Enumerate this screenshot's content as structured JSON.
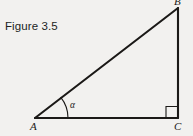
{
  "figure": {
    "caption": "Figure 3.5",
    "background_color": "#f2f1ef",
    "stroke_color": "#1b1917",
    "text_color": "#211f1e"
  },
  "diagram": {
    "type": "right-triangle",
    "vertices": [
      {
        "id": "A",
        "label": "A",
        "x": 35,
        "y": 118,
        "role": "acute-angle-vertex"
      },
      {
        "id": "B",
        "label": "B",
        "x": 178,
        "y": 8,
        "role": "apex-vertex"
      },
      {
        "id": "C",
        "label": "C",
        "x": 178,
        "y": 118,
        "role": "right-angle-vertex"
      }
    ],
    "edges": [
      {
        "id": "AC",
        "from": "A",
        "to": "C",
        "role": "adjacent-leg"
      },
      {
        "id": "CB",
        "from": "C",
        "to": "B",
        "role": "opposite-leg"
      },
      {
        "id": "AB",
        "from": "A",
        "to": "B",
        "role": "hypotenuse"
      }
    ],
    "angles": [
      {
        "id": "alpha",
        "label": "α",
        "at_vertex": "A",
        "marker": "arc"
      },
      {
        "id": "right-angle",
        "label": "",
        "at_vertex": "C",
        "marker": "square"
      }
    ]
  }
}
